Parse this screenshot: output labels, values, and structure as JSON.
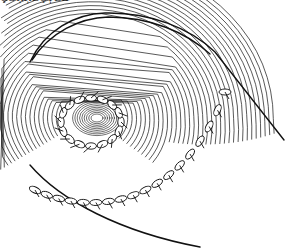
{
  "caption": {
    "text": "ÇƏŖŖÈÇȚĖĐ",
    "note": "cropped, illegible"
  },
  "illustration": {
    "subject": "line drawing of tubular organ end with sutured stoma",
    "stroke_color": "#111111",
    "background_color": "#ffffff"
  }
}
